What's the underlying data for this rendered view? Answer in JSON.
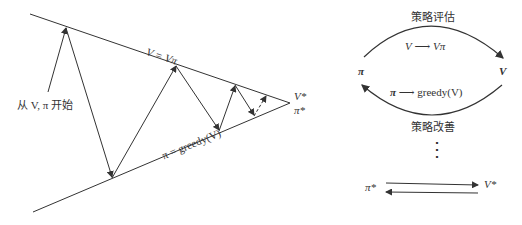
{
  "left_diagram": {
    "upper_line_label": "V = V^π",
    "upper_line_label_display": "V = Vπ",
    "lower_line_label": "π = greedy(V)",
    "start_label": "从 V, π 开始",
    "converge_label_v": "V*",
    "converge_label_pi": "π*"
  },
  "right_diagram": {
    "top_title": "策略评估",
    "top_expr_left": "V",
    "top_expr_arrow": "⟶",
    "top_expr_right": "Vπ",
    "left_node": "π",
    "right_node": "V",
    "bottom_expr_left": "π",
    "bottom_expr_arrow": "⟶",
    "bottom_expr_right": "greedy(V)",
    "bottom_title": "策略改善",
    "ellipsis": "⋮",
    "final_left": "π*",
    "final_right": "V*"
  },
  "colors": {
    "line": "#333333",
    "background": "#ffffff"
  }
}
